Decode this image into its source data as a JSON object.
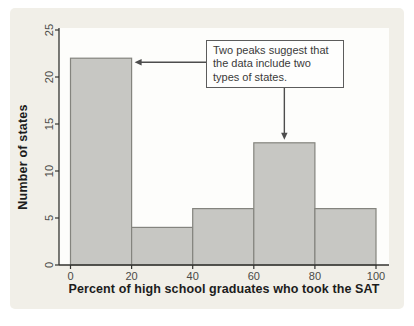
{
  "chart_data": {
    "type": "bar",
    "subtype": "histogram",
    "title": "",
    "xlabel": "Percent of high school graduates who took the SAT",
    "ylabel": "Number of states",
    "bin_edges": [
      0,
      20,
      40,
      60,
      80,
      100
    ],
    "values": [
      22,
      4,
      6,
      13,
      6
    ],
    "x_ticks": [
      "0",
      "20",
      "40",
      "60",
      "80",
      "100"
    ],
    "y_ticks": [
      "0",
      "5",
      "10",
      "15",
      "20",
      "25"
    ],
    "xlim": [
      0,
      100
    ],
    "ylim": [
      0,
      25
    ],
    "grid": "off",
    "legend": "none",
    "annotation": {
      "text": "Two peaks suggest that the data include two types of states.",
      "targets": [
        {
          "x": 20,
          "y": 22
        },
        {
          "x": 70,
          "y": 13
        }
      ]
    },
    "colors": {
      "panel_bg": "#f1efe8",
      "plot_bg": "#fdfdfb",
      "bar_fill": "#c7c7c3",
      "bar_stroke": "#84847e",
      "axis": "#333330",
      "tick_label": "#4a4a47",
      "arrow": "#4d4d4d",
      "annotation_border": "#5c5c5c"
    }
  }
}
